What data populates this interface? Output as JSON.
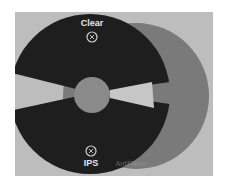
{
  "diagram": {
    "type": "disc-lens-diagram",
    "colors": {
      "page_background": "#ffffff",
      "panel": "#bdbdbd",
      "dark_disc": "#1e1e1e",
      "back_circle": "#7a7a7a",
      "center_hub": "#8a8a8a",
      "gap": "#c6c6c6",
      "label_text": "#e6e6e6",
      "faint_label_text": "#9a9a9a"
    },
    "labels": {
      "top": "Clear",
      "bottom": "IPS",
      "bottom_right_faint": "AntiFlicker"
    },
    "icons": {
      "top": "lens-icon",
      "bottom": "lens-icon"
    }
  }
}
